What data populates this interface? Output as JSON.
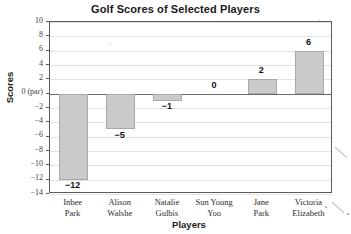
{
  "chart_data": {
    "type": "bar",
    "title": "Golf Scores of Selected Players",
    "xlabel": "Players",
    "ylabel": "Scores",
    "categories": [
      "Inbee Park",
      "Alison Walshe",
      "Natalie Gulbis",
      "Sun Young Yoo",
      "Jane Park",
      "Victoria Elizabeth"
    ],
    "category_lines": [
      [
        "Inbee",
        "Park"
      ],
      [
        "Alison",
        "Walshe"
      ],
      [
        "Natalie",
        "Gulbis"
      ],
      [
        "Sun Young",
        "Yoo"
      ],
      [
        "Jane",
        "Park"
      ],
      [
        "Victoria",
        "Elizabeth"
      ]
    ],
    "values": [
      -12,
      -5,
      -1,
      0,
      2,
      6
    ],
    "value_labels": [
      "−12",
      "−5",
      "−1",
      "0",
      "2",
      "6"
    ],
    "ylim": [
      -14,
      10
    ],
    "ytick_values": [
      10,
      8,
      6,
      4,
      2,
      0,
      -2,
      -4,
      -6,
      -8,
      -10,
      -12,
      -14
    ],
    "ytick_labels": [
      "10",
      "8",
      "6",
      "4",
      "2",
      "0 (par)",
      "−2",
      "−4",
      "−6",
      "−8",
      "−10",
      "−12",
      "−14"
    ],
    "grid": true,
    "legend": "none",
    "bar_color": "#cacaca",
    "bar_border_color": "#a8a8a8",
    "axis_color": "#5a5a5a",
    "gridline_color": "#e2e2e2",
    "zero_line_color": "#6b6b6b",
    "text_color": "#1a1a1a"
  }
}
